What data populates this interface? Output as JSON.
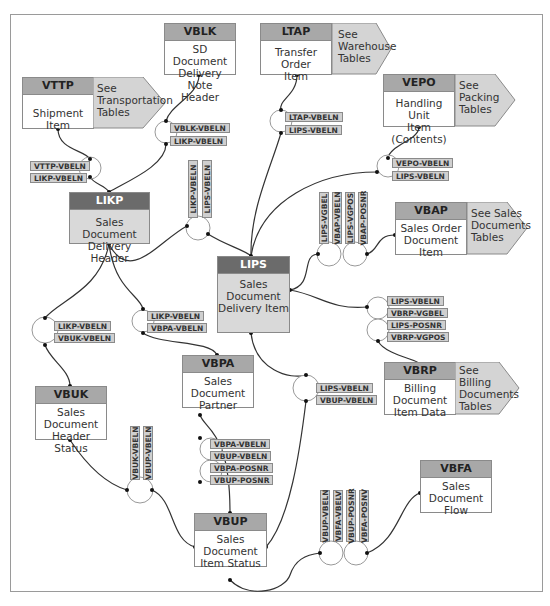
{
  "tables": {
    "vblk": {
      "name": "VBLK",
      "desc": "SD Document Delivery Note Header"
    },
    "ltap": {
      "name": "LTAP",
      "desc": "Transfer Order Item",
      "see": "See Warehouse Tables"
    },
    "vttp": {
      "name": "VTTP",
      "desc": "Shipment Item",
      "see": "See Transportation Tables"
    },
    "vepo": {
      "name": "VEPO",
      "desc": "Handling Unit Item (Contents)",
      "see": "See Packing Tables"
    },
    "likp": {
      "name": "LIKP",
      "desc": "Sales Document Delivery Header"
    },
    "vbap": {
      "name": "VBAP",
      "desc": "Sales Order Document Item",
      "see": "See Sales Documents Tables"
    },
    "lips": {
      "name": "LIPS",
      "desc": "Sales Document Delivery Item"
    },
    "vbpa": {
      "name": "VBPA",
      "desc": "Sales Document Partner"
    },
    "vbuk": {
      "name": "VBUK",
      "desc": "Sales Document Header Status"
    },
    "vbrp": {
      "name": "VBRP",
      "desc": "Billing Document Item Data",
      "see": "See Billing Documents Tables"
    },
    "vbfa": {
      "name": "VBFA",
      "desc": "Sales Document Flow"
    },
    "vbup": {
      "name": "VBUP",
      "desc": "Sales Document Item Status"
    }
  },
  "desc_lines": {
    "vblk": [
      "SD Document",
      "Delivery Note",
      "Header"
    ],
    "ltap": [
      "Transfer Order",
      "Item"
    ],
    "vttp": [
      "Shipment Item"
    ],
    "vepo": [
      "Handling Unit",
      "Item (Contents)"
    ],
    "likp": [
      "Sales Document",
      "Delivery Header"
    ],
    "vbap": [
      "Sales Order",
      "Document",
      "Item"
    ],
    "lips": [
      "Sales",
      "Document",
      "Delivery Item"
    ],
    "vbpa": [
      "Sales",
      "Document",
      "Partner"
    ],
    "vbuk": [
      "Sales",
      "Document",
      "Header Status"
    ],
    "vbrp": [
      "Billing",
      "Document",
      "Item Data"
    ],
    "vbfa": [
      "Sales",
      "Document",
      "Flow"
    ],
    "vbup": [
      "Sales",
      "Document",
      "Item Status"
    ]
  },
  "see_lines": {
    "ltap": [
      "See",
      "Warehouse",
      "Tables"
    ],
    "vttp": [
      "See",
      "Transportation",
      "Tables"
    ],
    "vepo": [
      "See",
      "Packing",
      "Tables"
    ],
    "vbap": [
      "See Sales",
      "Documents",
      "Tables"
    ],
    "vbrp": [
      "See",
      "Billing",
      "Documents",
      "Tables"
    ]
  },
  "joins": {
    "vblk_likp": [
      "VBLK-VBELN",
      "LIKP-VBELN"
    ],
    "ltap_lips": [
      "LTAP-VBELN",
      "LIPS-VBELN"
    ],
    "vttp_likp": [
      "VTTP-VBELN",
      "LIKP-VBELN"
    ],
    "vepo_lips": [
      "VEPO-VBELN",
      "LIPS-VBELN"
    ],
    "likp_lips": [
      "LIKP-VBELN",
      "LIPS-VBELN"
    ],
    "lips_vbap": [
      "LIPS-VGBEL",
      "VBAP-VBELN",
      "LIPS-VGPOS",
      "VBAP-POSNR"
    ],
    "likp_vbuk": [
      "LIKP-VBELN",
      "VBUK-VBELN"
    ],
    "likp_vbpa": [
      "LIKP-VBELN",
      "VBPA-VBELN"
    ],
    "lips_vbrp": [
      "LIPS-VBELN",
      "VBRP-VGBEL",
      "LIPS-POSNR",
      "VBRP-VGPOS"
    ],
    "lips_vbup": [
      "LIPS-VBELN",
      "VBUP-VBELN"
    ],
    "vbuk_vbup": [
      "VBUK-VBELN",
      "VBUP-VBELN"
    ],
    "vbpa_vbup": [
      "VBPA-VBELN",
      "VBUP-VBELN",
      "VBPA-POSNR",
      "VBUP-POSNR"
    ],
    "vbup_vbfa": [
      "VBUP-VBELN",
      "VBFA-VBELV",
      "VBUP-POSNR",
      "VBFA-POSNV"
    ]
  },
  "colors": {
    "header_light": "#a8a8a8",
    "header_dark": "#6b6b6b",
    "key_fill": "#cfcfcf",
    "arrow_fill": "#d4d4d4",
    "line": "#333333"
  }
}
